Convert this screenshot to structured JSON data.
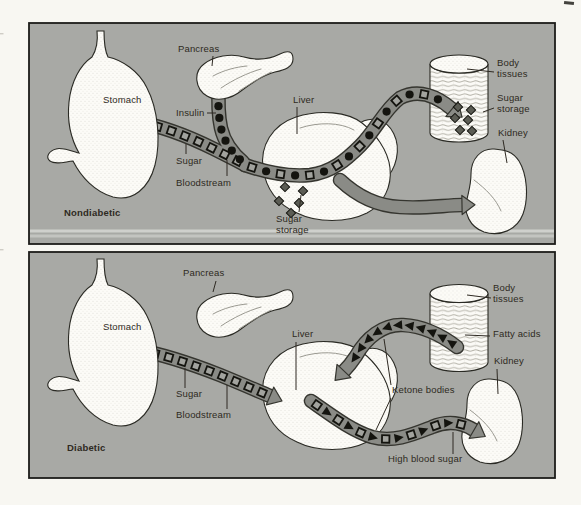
{
  "panels": [
    {
      "id": "nondiabetic",
      "caption": "Nondiabetic",
      "labels": {
        "pancreas": "Pancreas",
        "stomach": "Stomach",
        "insulin": "Insulin",
        "sugar": "Sugar",
        "bloodstream": "Bloodstream",
        "liver": "Liver",
        "body_tissues": "Body tissues",
        "sugar_storage": "Sugar storage",
        "kidney": "Kidney",
        "liver_sugar_storage": "Sugar storage"
      }
    },
    {
      "id": "diabetic",
      "caption": "Diabetic",
      "labels": {
        "pancreas": "Pancreas",
        "stomach": "Stomach",
        "sugar": "Sugar",
        "bloodstream": "Bloodstream",
        "liver": "Liver",
        "body_tissues": "Body tissues",
        "fatty_acids": "Fatty acids",
        "kidney": "Kidney",
        "ketone_bodies": "Ketone bodies",
        "high_blood_sugar": "High blood sugar"
      }
    }
  ],
  "vessels": [
    {
      "id": "nd-sugar",
      "symbols": [
        "square"
      ],
      "count": 8,
      "arrow": false,
      "span": [
        0.08,
        0.93
      ]
    },
    {
      "id": "nd-insulin",
      "symbols": [
        "circle"
      ],
      "count": 7,
      "arrow": false,
      "span": [
        0.1,
        0.95
      ]
    },
    {
      "id": "nd-mixed",
      "symbols": [
        "square",
        "circle"
      ],
      "count": 16,
      "arrow": true,
      "span": [
        0.03,
        0.93
      ]
    },
    {
      "id": "nd-plain",
      "symbols": [],
      "count": 0,
      "arrow": true,
      "span": [
        0,
        1
      ]
    },
    {
      "id": "d-sugar",
      "symbols": [
        "square"
      ],
      "count": 10,
      "arrow": true,
      "span": [
        0.05,
        0.94
      ]
    },
    {
      "id": "d-fatty",
      "symbols": [
        "triangle"
      ],
      "count": 11,
      "arrow": true,
      "span": [
        0.05,
        0.88
      ]
    },
    {
      "id": "d-ketone",
      "symbols": [
        "square",
        "triangle"
      ],
      "count": 13,
      "arrow": true,
      "span": [
        0.04,
        0.92
      ]
    }
  ],
  "colors": {
    "page_bg": "#f8f7f2",
    "panel_bg": "#a8a9a5",
    "panel_border": "#1c1c1a",
    "strip": "#d6d7d2",
    "vessel": "#8a8b86",
    "vessel_outline": "#35352f",
    "symbol_black": "#14140f",
    "square_fill": "#a2a39e",
    "diamond_fill": "#5b5c54",
    "organ_outline": "#2a2a24",
    "label_color": "#2e2922",
    "leader": "#2e2922"
  }
}
